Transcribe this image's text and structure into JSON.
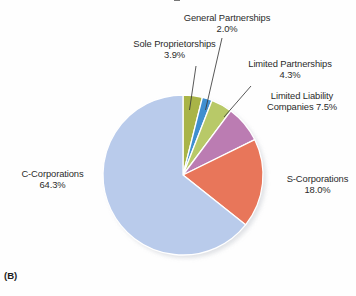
{
  "figure": {
    "panel_tag": "(B)",
    "background_color": "#fefefe"
  },
  "chart_data": {
    "type": "pie",
    "title": "",
    "xlabel": "",
    "ylabel": "",
    "legend_position": "none",
    "grid": false,
    "units": "percent",
    "start_angle_deg": 0,
    "direction": "clockwise",
    "total": 100.0,
    "categories": [
      "Sole Proprietorships",
      "General Partnerships",
      "Limited Partnerships",
      "Limited Liability Companies",
      "S-Corporations",
      "C-Corporations"
    ],
    "values": [
      3.9,
      2.0,
      4.3,
      7.5,
      18.0,
      64.3
    ],
    "colors": [
      "#a9b447",
      "#3f8fd0",
      "#b8c968",
      "#bb7cb2",
      "#e8765a",
      "#b9cbeb"
    ],
    "slices": [
      {
        "name": "Sole Proprietorships",
        "value": 3.9,
        "value_label": "3.9%",
        "color": "#a9b447",
        "label_line1": "Sole Proprietorships",
        "label_line2": "3.9%",
        "leader_line": true
      },
      {
        "name": "General Partnerships",
        "value": 2.0,
        "value_label": "2.0%",
        "color": "#3f8fd0",
        "label_line1": "General Partnerships",
        "label_line2": "2.0%",
        "leader_line": true
      },
      {
        "name": "Limited Partnerships",
        "value": 4.3,
        "value_label": "4.3%",
        "color": "#b8c968",
        "label_line1": "Limited Partnerships",
        "label_line2": "4.3%",
        "leader_line": true
      },
      {
        "name": "Limited Liability Companies",
        "value": 7.5,
        "value_label": "7.5%",
        "color": "#bb7cb2",
        "label_line1": "Limited Liability",
        "label_line2": "Companies 7.5%",
        "leader_line": false
      },
      {
        "name": "S-Corporations",
        "value": 18.0,
        "value_label": "18.0%",
        "color": "#e8765a",
        "label_line1": "S-Corporations",
        "label_line2": "18.0%",
        "leader_line": false
      },
      {
        "name": "C-Corporations",
        "value": 64.3,
        "value_label": "64.3%",
        "color": "#b9cbeb",
        "label_line1": "C-Corporations",
        "label_line2": "64.3%",
        "leader_line": false
      }
    ]
  }
}
